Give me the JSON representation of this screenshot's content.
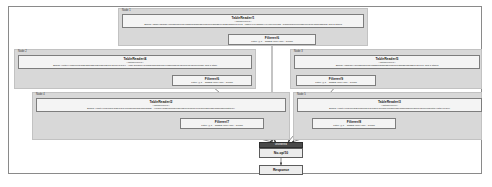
{
  "diagram": {
    "type": "query-execution-plan",
    "clusters": [
      {
        "label": "Node 1",
        "x": 118,
        "y": 8,
        "w": 250,
        "h": 38,
        "reader": {
          "name": "TableReader/1",
          "subtitle": "<dataSources>",
          "spec": "Spans: /Table/\"f5ae5e\"/f0ea3a/de1ed9/a38bca/b5a0d5/c0a81c/e5ba35/e9cb35/ad51ce1/j/1/2 , /Table/\"f4c45gbhe\"/\"e40a4ec1/ad1 -8/a0f/ca8f/ce0f/ca38/ca45/ca4ba5/ad5ca3\" and 3 others",
          "bx": 122,
          "by": 14,
          "bw": 242,
          "bh": 14
        },
        "filter": {
          "name": "Filterer/6",
          "detail": "Filter: @7 = 53852 (likely fail) - 17036",
          "bx": 228,
          "by": 34,
          "bw": 88,
          "bh": 11
        }
      },
      {
        "label": "Node 2",
        "x": 14,
        "y": 49,
        "w": 242,
        "h": 40,
        "reader": {
          "name": "TableReader/4",
          "subtitle": "<dataSources>",
          "spec": "Spans: /\"rota4\"/\"ad8/ca45/ad5/ad5/ad5/ca5/ca5/ca5/ca45/ca4/a-s/1/4 , /\"sar-fa/odea/\"/1/caa5/ca5/ca5/ca74/ca5f/ca8f/ca45/ca4f/ca45/ca4f/ca8f\" and 1 other",
          "bx": 18,
          "by": 55,
          "bw": 234,
          "bh": 14
        },
        "filter": {
          "name": "Filterer/6",
          "detail": "Filter: @1 = 53852 (likely fail) - 17036",
          "bx": 172,
          "by": 75,
          "bw": 80,
          "bh": 11
        }
      },
      {
        "label": "Node 3",
        "x": 290,
        "y": 49,
        "w": 192,
        "h": 40,
        "reader": {
          "name": "TableReader/5",
          "subtitle": "<dataSources>",
          "spec": "Spans: /\"f5ae5e\"/\"f0ea3a/de1ed9/a38bca/b5a0d5/c0a81c/e5ba35/e5ba35/a45/j/1/1\" and 1 others",
          "bx": 294,
          "by": 55,
          "bw": 186,
          "bh": 14
        },
        "filter": {
          "name": "Filterer/9",
          "detail": "Filter: @1 = 53852 (likely fail) - 17036",
          "bx": 296,
          "by": 75,
          "bw": 80,
          "bh": 11
        }
      },
      {
        "label": "Node 4",
        "x": 32,
        "y": 92,
        "w": 258,
        "h": 48,
        "reader": {
          "name": "TableReader/2",
          "subtitle": "<dataSources>",
          "spec": "Spans: /\"part\"/\"a45/ca0h-ga5/a4b/a4f/ca5/ca5/ca5/ca5/ca5a5 , /\"/para/\"/aa5f/ca0f/f5/ca5/ca5/a4b/ca0a4f/ca4bf/ca5f/ca5f/ca5f/ca5f/radita/a4\"",
          "bx": 36,
          "by": 98,
          "bw": 254,
          "bh": 14
        },
        "filter": {
          "name": "Filterer/7",
          "detail": "Filter: @7 = 53852 (likely fail) - 17036",
          "bx": 180,
          "by": 118,
          "bw": 84,
          "bh": 11
        }
      },
      {
        "label": "Node 5",
        "x": 293,
        "y": 92,
        "w": 189,
        "h": 48,
        "reader": {
          "name": "TableReader/3",
          "subtitle": "<dataSources>",
          "spec": "Spans: /\"part\"/\"a45/ca45/f5/ca5/ca5/a4b/ca5/a4b/ca0a4f/ca5f/ca5f/ca5f/ca5f/ca45f/ca45f/ca4f/f5/rota/\"/rata/\"/a45/rv",
          "bx": 297,
          "by": 98,
          "bw": 248,
          "bh": 14
        },
        "filter": {
          "name": "Filterer/8",
          "detail": "Filter: @7 = 53852 (likely fail) - 17036",
          "bx": 312,
          "by": 118,
          "bw": 84,
          "bh": 11
        }
      }
    ],
    "highlight": {
      "label": "unordered",
      "x": 259,
      "y": 142,
      "w": 44,
      "h": 6
    },
    "merge": {
      "name": "No-op/10",
      "x": 259,
      "y": 148,
      "w": 44,
      "h": 10
    },
    "response": {
      "name": "Response",
      "x": 259,
      "y": 165,
      "w": 44,
      "h": 10
    },
    "colors": {
      "cluster_fill": "#d8d8d8",
      "box_fill": "#f4f4f4",
      "box_border": "#7d7d7d",
      "highlight_fill": "#4a4a4a",
      "edge": "#3a3a3a",
      "frame_border": "#8a8a8a"
    },
    "edges": [
      {
        "from": "TableReader/1",
        "to": "Filterer/6"
      },
      {
        "from": "TableReader/4",
        "to": "Filterer/6b"
      },
      {
        "from": "TableReader/5",
        "to": "Filterer/9"
      },
      {
        "from": "TableReader/2",
        "to": "Filterer/7"
      },
      {
        "from": "TableReader/3",
        "to": "Filterer/8"
      },
      {
        "from": "Filterer/6",
        "to": "No-op/10"
      },
      {
        "from": "Filterer/6b",
        "to": "No-op/10"
      },
      {
        "from": "Filterer/9",
        "to": "No-op/10"
      },
      {
        "from": "Filterer/7",
        "to": "No-op/10"
      },
      {
        "from": "Filterer/8",
        "to": "No-op/10"
      },
      {
        "from": "No-op/10",
        "to": "Response"
      }
    ]
  }
}
